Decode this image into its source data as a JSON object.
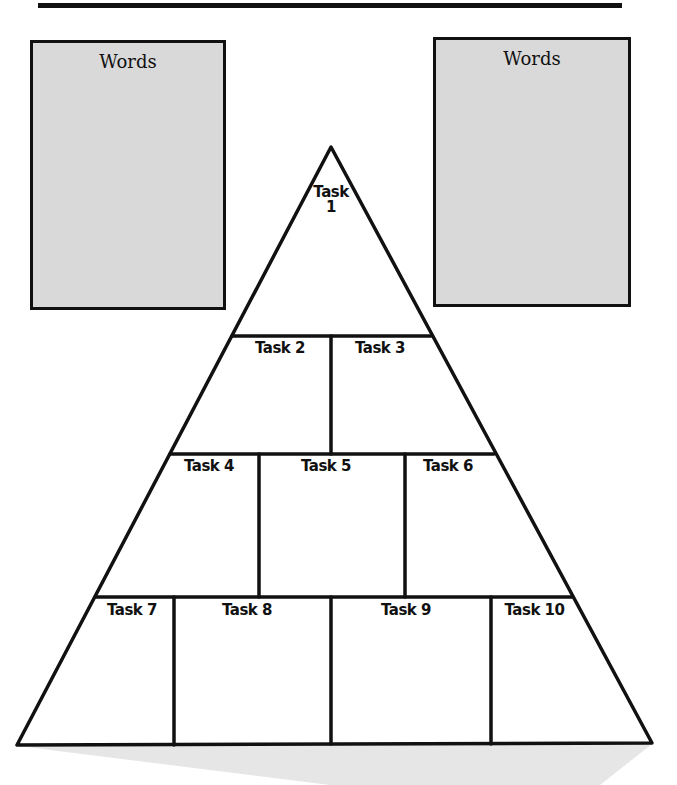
{
  "worksheet": {
    "word_boxes": [
      {
        "title": "Words"
      },
      {
        "title": "Words"
      }
    ],
    "pyramid": {
      "rows": [
        {
          "tasks": [
            "Task\n1"
          ]
        },
        {
          "tasks": [
            "Task 2",
            "Task 3"
          ]
        },
        {
          "tasks": [
            "Task 4",
            "Task 5",
            "Task 6"
          ]
        },
        {
          "tasks": [
            "Task 7",
            "Task 8",
            "Task 9",
            "Task 10"
          ]
        }
      ],
      "task1_line1": "Task",
      "task1_line2": "1"
    },
    "colors": {
      "box_fill": "#d9d9d9",
      "line": "#111111",
      "shadow": "#e6e6e6"
    }
  }
}
